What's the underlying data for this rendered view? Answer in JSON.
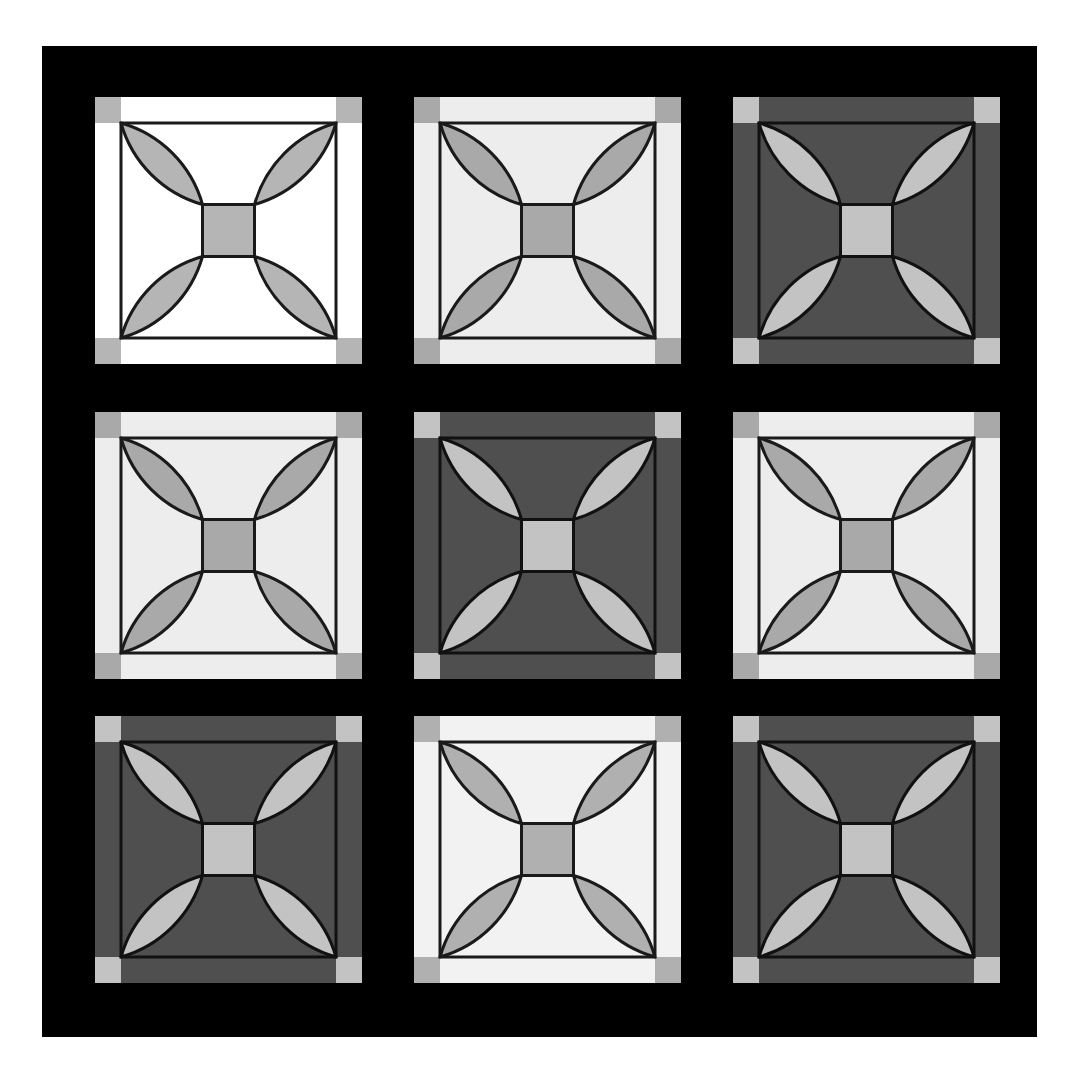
{
  "artwork": {
    "title": "Nine Decorative Ceramic Tiles",
    "canvas": {
      "width": 1090,
      "height": 1078
    },
    "page_background": "#ffffff",
    "frame": {
      "name": "black-mat-frame",
      "color": "#000000",
      "x": 42,
      "y": 46,
      "width": 995,
      "height": 991
    },
    "grid": {
      "rows": 3,
      "columns": 3,
      "tile_size": 267,
      "column_x": [
        95,
        414,
        733
      ],
      "row_y": [
        97,
        412,
        716
      ]
    },
    "motif": {
      "name": "four-petal-quatrefoil",
      "elements": [
        "corner-square",
        "border-outline",
        "petal-top-left",
        "petal-top-right",
        "petal-bottom-left",
        "petal-bottom-right",
        "center-square"
      ],
      "outline_color": "#1a1a1a",
      "outline_width": 3,
      "corner_square_size": 26,
      "center_square_size": 52,
      "petal_radius": 118
    },
    "palettes": {
      "white": {
        "background": "#ffffff",
        "petal": "#b5b5b5",
        "corner": "#b5b5b5",
        "center": "#b5b5b5",
        "outline": "#1a1a1a"
      },
      "light": {
        "background": "#ededed",
        "petal": "#a9a9a9",
        "corner": "#a9a9a9",
        "center": "#a9a9a9",
        "outline": "#1a1a1a"
      },
      "dark": {
        "background": "#4f4f4f",
        "petal": "#c3c3c3",
        "corner": "#c3c3c3",
        "center": "#c3c3c3",
        "outline": "#111111"
      },
      "pale": {
        "background": "#f2f2f2",
        "petal": "#b0b0b0",
        "corner": "#b0b0b0",
        "center": "#b0b0b0",
        "outline": "#1a1a1a"
      }
    },
    "tiles": [
      {
        "id": "tile-r0-c0",
        "row": 0,
        "col": 0,
        "palette": "white",
        "label": "Tile 1"
      },
      {
        "id": "tile-r0-c1",
        "row": 0,
        "col": 1,
        "palette": "light",
        "label": "Tile 2"
      },
      {
        "id": "tile-r0-c2",
        "row": 0,
        "col": 2,
        "palette": "dark",
        "label": "Tile 3"
      },
      {
        "id": "tile-r1-c0",
        "row": 1,
        "col": 0,
        "palette": "light",
        "label": "Tile 4"
      },
      {
        "id": "tile-r1-c1",
        "row": 1,
        "col": 1,
        "palette": "dark",
        "label": "Tile 5"
      },
      {
        "id": "tile-r1-c2",
        "row": 1,
        "col": 2,
        "palette": "light",
        "label": "Tile 6"
      },
      {
        "id": "tile-r2-c0",
        "row": 2,
        "col": 0,
        "palette": "dark",
        "label": "Tile 7"
      },
      {
        "id": "tile-r2-c1",
        "row": 2,
        "col": 1,
        "palette": "pale",
        "label": "Tile 8"
      },
      {
        "id": "tile-r2-c2",
        "row": 2,
        "col": 2,
        "palette": "dark",
        "label": "Tile 9"
      }
    ]
  }
}
